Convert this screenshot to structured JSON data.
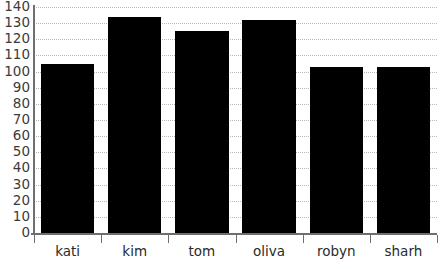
{
  "chart_data": {
    "type": "bar",
    "title": "",
    "subtitle": "",
    "xlabel": "",
    "ylabel": "",
    "categories": [
      "kati",
      "kim",
      "tom",
      "oliva",
      "robyn",
      "sharh"
    ],
    "values": [
      105,
      134,
      125,
      132,
      103,
      103
    ],
    "series": [
      {
        "name": "",
        "values": [
          105,
          134,
          125,
          132,
          103,
          103
        ]
      }
    ],
    "ylim": [
      0,
      140
    ],
    "ytick_step": 10,
    "yticks": [
      0,
      10,
      20,
      30,
      40,
      50,
      60,
      70,
      80,
      90,
      100,
      110,
      120,
      130,
      140
    ],
    "ytick_labels": [
      "0",
      "10",
      "20",
      "30",
      "40",
      "50",
      "60",
      "70",
      "80",
      "90",
      "100",
      "110",
      "120",
      "130",
      "140"
    ],
    "grid": true,
    "grid_axis": "y",
    "grid_style": "dotted",
    "legend": false,
    "legend_position": "none",
    "annotations": [],
    "colors": {
      "bar": "#000000",
      "grid": "#b9b9b9",
      "axis": "#6e6e6e",
      "background": "#ffffff",
      "ytick_label": "#3b3b3b",
      "xtick_label": "#2a2a2a"
    }
  }
}
